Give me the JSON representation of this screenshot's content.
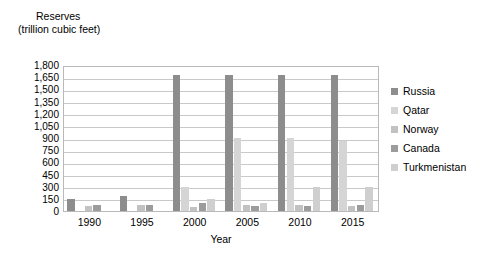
{
  "chart_data": {
    "type": "bar",
    "title": "Reserves",
    "subtitle": "(trillion cubic feet)",
    "xlabel": "Year",
    "ylabel": "",
    "categories": [
      "1990",
      "1995",
      "2000",
      "2005",
      "2010",
      "2015"
    ],
    "ylim": [
      0,
      1800
    ],
    "yticks": [
      0,
      150,
      300,
      450,
      600,
      750,
      900,
      1050,
      1200,
      1350,
      1500,
      1650,
      1800
    ],
    "ytick_labels": [
      "0",
      "150",
      "300",
      "450",
      "600",
      "750",
      "900",
      "1,050",
      "1,200",
      "1,350",
      "1,500",
      "1,650",
      "1,800"
    ],
    "grid": true,
    "legend_position": "right",
    "series": [
      {
        "name": "Russia",
        "color": "#8d8d8d",
        "values": [
          150,
          190,
          1680,
          1680,
          1680,
          1680
        ]
      },
      {
        "name": "Qatar",
        "color": "#d5d5d5",
        "values": [
          0,
          0,
          290,
          900,
          900,
          860
        ]
      },
      {
        "name": "Norway",
        "color": "#c2c2c2",
        "values": [
          60,
          70,
          45,
          80,
          70,
          60
        ]
      },
      {
        "name": "Canada",
        "color": "#9c9c9c",
        "values": [
          75,
          80,
          95,
          60,
          60,
          70
        ]
      },
      {
        "name": "Turkmenistan",
        "color": "#cfcfcf",
        "values": [
          0,
          0,
          150,
          100,
          290,
          290
        ]
      }
    ]
  },
  "legend": {
    "items": [
      {
        "label": "Russia",
        "color": "#8d8d8d"
      },
      {
        "label": "Qatar",
        "color": "#d5d5d5"
      },
      {
        "label": "Norway",
        "color": "#c2c2c2"
      },
      {
        "label": "Canada",
        "color": "#9c9c9c"
      },
      {
        "label": "Turkmenistan",
        "color": "#cfcfcf"
      }
    ]
  }
}
